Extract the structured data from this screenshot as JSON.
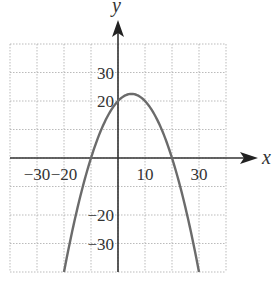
{
  "chart_data": {
    "type": "line",
    "title": "",
    "xlabel": "x",
    "ylabel": "y",
    "xlim": [
      -40,
      40
    ],
    "ylim": [
      -40,
      40
    ],
    "grid": true,
    "grid_step": 10,
    "x_tick_labels": [
      "-30",
      "-20",
      "10",
      "30"
    ],
    "x_tick_values": [
      -30,
      -20,
      10,
      30
    ],
    "y_tick_labels": [
      "30",
      "20",
      "-20",
      "-30"
    ],
    "y_tick_values": [
      30,
      20,
      -20,
      -30
    ],
    "series": [
      {
        "name": "y = -0.1(x + 10)(x - 20)",
        "color": "#6b6b6b",
        "x": [
          -20,
          -15,
          -10,
          -5,
          0,
          5,
          10,
          15,
          20,
          25,
          30
        ],
        "y": [
          -40,
          -17.5,
          0,
          12.5,
          20,
          22.5,
          20,
          12.5,
          0,
          -17.5,
          -40
        ]
      }
    ]
  }
}
